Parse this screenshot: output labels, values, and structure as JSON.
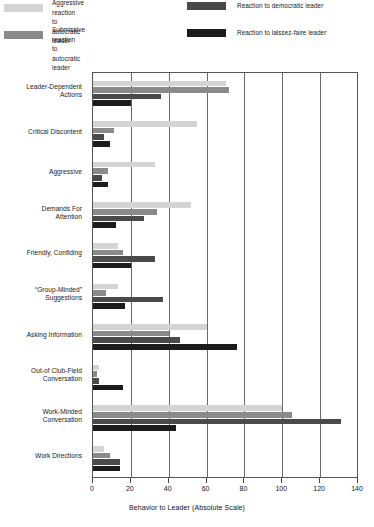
{
  "legend": {
    "entries": [
      {
        "label": "Aggressive reaction\nto autocratic leader",
        "color": "#d4d4d4",
        "key": "aggressive-autocratic"
      },
      {
        "label": "Submissive reaction\nto autocratic leader",
        "color": "#8a8a8a",
        "key": "submissive-autocratic"
      },
      {
        "label": "Reaction to democratic leader",
        "color": "#4a4a4a",
        "key": "democratic"
      },
      {
        "label": "Reaction to laissez-faire leader",
        "color": "#1c1c1c",
        "key": "laissez-faire"
      }
    ]
  },
  "axis": {
    "x_title": "Behavior to Leader (Absolute Scale)",
    "ticks": [
      "0",
      "20",
      "40",
      "60",
      "80",
      "100",
      "120",
      "140"
    ]
  },
  "chart_data": {
    "type": "bar",
    "orientation": "horizontal",
    "title": "",
    "xlabel": "Behavior to Leader (Absolute Scale)",
    "ylabel": "",
    "xlim": [
      0,
      140
    ],
    "xticks": [
      0,
      20,
      40,
      60,
      80,
      100,
      120,
      140
    ],
    "grid": true,
    "legend_position": "top",
    "categories": [
      "Leader-Dependent\nActions",
      "Critical Discontent",
      "Aggressive",
      "Demands For\nAttention",
      "Friendly, Confiding",
      "“Group-Minded”\nSuggestions",
      "Asking Information",
      "Out-of Club-Field\nConversation",
      "Work-Minded\nConversation",
      "Work Directions"
    ],
    "series": [
      {
        "name": "Aggressive reaction to autocratic leader",
        "color": "#d4d4d4",
        "values": [
          70,
          55,
          33,
          52,
          13,
          13,
          60,
          3,
          100,
          6
        ]
      },
      {
        "name": "Submissive reaction to autocratic leader",
        "color": "#8a8a8a",
        "values": [
          72,
          11,
          8,
          34,
          16,
          7,
          40,
          2,
          105,
          9
        ]
      },
      {
        "name": "Reaction to democratic leader",
        "color": "#4a4a4a",
        "values": [
          36,
          6,
          5,
          27,
          33,
          37,
          46,
          3,
          131,
          14
        ]
      },
      {
        "name": "Reaction to laissez-faire leader",
        "color": "#1c1c1c",
        "values": [
          20,
          9,
          8,
          12,
          20,
          17,
          76,
          16,
          44,
          14
        ]
      }
    ]
  }
}
